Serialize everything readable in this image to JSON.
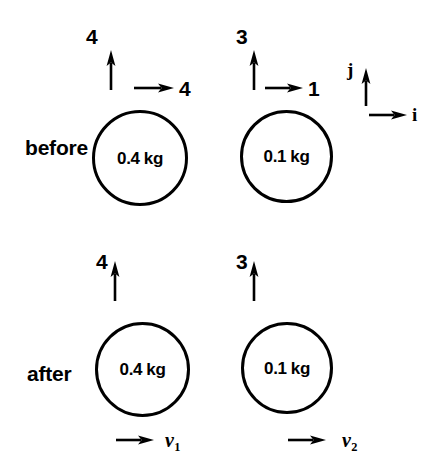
{
  "figure": {
    "background": "#ffffff",
    "ink": "#000000"
  },
  "rows": [
    {
      "name": "before",
      "label": "before",
      "bodies": [
        {
          "name": "body-1",
          "mass_label": "0.4 kg",
          "vertical_arrow": {
            "label": "4",
            "direction": "up"
          },
          "horizontal_arrow": {
            "label": "4",
            "direction": "right"
          }
        },
        {
          "name": "body-2",
          "mass_label": "0.1 kg",
          "vertical_arrow": {
            "label": "3",
            "direction": "up"
          },
          "horizontal_arrow": {
            "label": "1",
            "direction": "right"
          }
        }
      ]
    },
    {
      "name": "after",
      "label": "after",
      "bodies": [
        {
          "name": "body-1",
          "mass_label": "0.4 kg",
          "vertical_arrow": {
            "label": "4",
            "direction": "up"
          },
          "below_arrow": {
            "label_base": "v",
            "label_sub": "1",
            "direction": "right"
          }
        },
        {
          "name": "body-2",
          "mass_label": "0.1 kg",
          "vertical_arrow": {
            "label": "3",
            "direction": "up"
          },
          "below_arrow": {
            "label_base": "v",
            "label_sub": "2",
            "direction": "right"
          }
        }
      ]
    }
  ],
  "basis": {
    "name": "unit-vector-key",
    "vertical": {
      "label": "j",
      "direction": "up"
    },
    "horizontal": {
      "label": "i",
      "direction": "right"
    }
  }
}
